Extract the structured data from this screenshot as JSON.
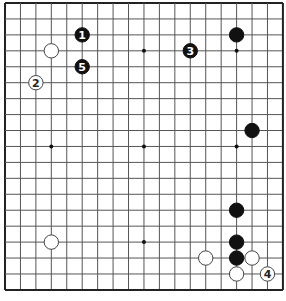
{
  "board": {
    "size": 19,
    "origin_x": 5,
    "origin_y": 3,
    "spacing_x": 15.44,
    "spacing_y": 15.94,
    "line_color": "#555555",
    "edge_color": "#222222",
    "background": "#ffffff",
    "star_points": [
      [
        3,
        3
      ],
      [
        3,
        9
      ],
      [
        3,
        15
      ],
      [
        9,
        3
      ],
      [
        9,
        9
      ],
      [
        9,
        15
      ],
      [
        15,
        3
      ],
      [
        15,
        9
      ],
      [
        15,
        15
      ]
    ]
  },
  "stones": [
    {
      "color": "black",
      "col": 5,
      "row": 2,
      "label": "1"
    },
    {
      "color": "white",
      "col": 3,
      "row": 3,
      "label": ""
    },
    {
      "color": "black",
      "col": 5,
      "row": 4,
      "label": "5"
    },
    {
      "color": "white",
      "col": 2,
      "row": 5,
      "label": "2"
    },
    {
      "color": "black",
      "col": 12,
      "row": 3,
      "label": "3"
    },
    {
      "color": "black",
      "col": 15,
      "row": 2,
      "label": ""
    },
    {
      "color": "black",
      "col": 16,
      "row": 8,
      "label": ""
    },
    {
      "color": "black",
      "col": 15,
      "row": 13,
      "label": ""
    },
    {
      "color": "black",
      "col": 15,
      "row": 15,
      "label": ""
    },
    {
      "color": "black",
      "col": 15,
      "row": 16,
      "label": ""
    },
    {
      "color": "white",
      "col": 13,
      "row": 16,
      "label": ""
    },
    {
      "color": "white",
      "col": 16,
      "row": 16,
      "label": ""
    },
    {
      "color": "white",
      "col": 15,
      "row": 17,
      "label": ""
    },
    {
      "color": "white",
      "col": 17,
      "row": 17,
      "label": "4"
    },
    {
      "color": "white",
      "col": 3,
      "row": 15,
      "label": ""
    }
  ]
}
